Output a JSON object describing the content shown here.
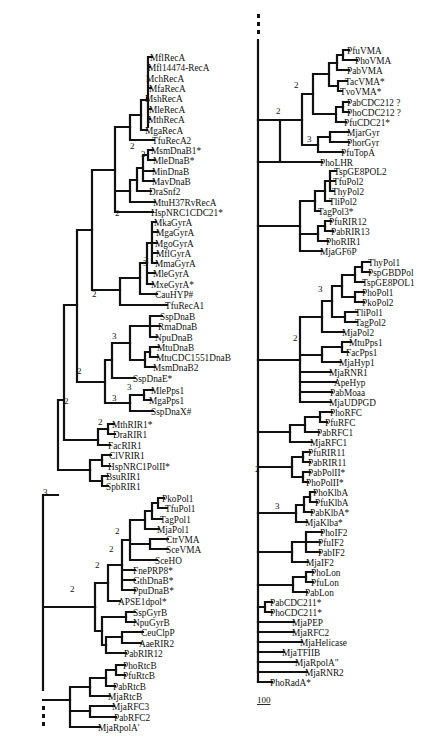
{
  "figure": {
    "type": "phylogenetic-tree",
    "panels": 2,
    "scale_bar_label": "100",
    "continuation_marker": "⋮",
    "line_color": "#111111",
    "background": "#ffffff"
  },
  "left_tree": {
    "leaves": [
      {
        "label": "MflRecA",
        "x": 150,
        "y": 57
      },
      {
        "label": "Mfl14474-RecA",
        "x": 148,
        "y": 67
      },
      {
        "label": "MchRecA",
        "x": 146,
        "y": 78
      },
      {
        "label": "MfaRecA",
        "x": 149,
        "y": 88
      },
      {
        "label": "MshRecA",
        "x": 145,
        "y": 98
      },
      {
        "label": "MleRecA",
        "x": 149,
        "y": 109
      },
      {
        "label": "MthRecA",
        "x": 148,
        "y": 119
      },
      {
        "label": "MgaRecA",
        "x": 145,
        "y": 130
      },
      {
        "label": "TfuRecA2",
        "x": 152,
        "y": 140
      },
      {
        "label": "MsmDnaB1*",
        "x": 151,
        "y": 150
      },
      {
        "label": "MleDnaB*",
        "x": 153,
        "y": 160
      },
      {
        "label": "MinDnaB",
        "x": 152,
        "y": 171
      },
      {
        "label": "MavDnaB",
        "x": 152,
        "y": 181
      },
      {
        "label": "DraSnf2",
        "x": 149,
        "y": 191
      },
      {
        "label": "MtuH37RvRecA",
        "x": 153,
        "y": 202
      },
      {
        "label": "HspNRC1CDC21*",
        "x": 151,
        "y": 212
      },
      {
        "label": "MkaGyrA",
        "x": 154,
        "y": 222
      },
      {
        "label": "MgaGyrA",
        "x": 156,
        "y": 232
      },
      {
        "label": "MgoGyrA",
        "x": 155,
        "y": 243
      },
      {
        "label": "MflGyrA",
        "x": 156,
        "y": 253
      },
      {
        "label": "MmaGyrA",
        "x": 155,
        "y": 263
      },
      {
        "label": "MleGyrA",
        "x": 153,
        "y": 273
      },
      {
        "label": "MxeGyrA*",
        "x": 151,
        "y": 284
      },
      {
        "label": "CauHYP#",
        "x": 155,
        "y": 294
      },
      {
        "label": "TfuRecA1",
        "x": 165,
        "y": 305
      },
      {
        "label": "SspDnaB",
        "x": 160,
        "y": 316
      },
      {
        "label": "RmaDnaB",
        "x": 158,
        "y": 326
      },
      {
        "label": "NpuDnaB",
        "x": 155,
        "y": 337
      },
      {
        "label": "MtuDnaB",
        "x": 157,
        "y": 347
      },
      {
        "label": "MtuCDC1551DnaB",
        "x": 156,
        "y": 357
      },
      {
        "label": "MsmDnaB2",
        "x": 153,
        "y": 367
      },
      {
        "label": "SspDnaE*",
        "x": 133,
        "y": 378
      },
      {
        "label": "MlePps1",
        "x": 151,
        "y": 390
      },
      {
        "label": "MgaPps1",
        "x": 149,
        "y": 400
      },
      {
        "label": "SspDnaX#",
        "x": 151,
        "y": 411
      },
      {
        "label": "MthRIR1*",
        "x": 112,
        "y": 424
      },
      {
        "label": "DraRIR1",
        "x": 113,
        "y": 434
      },
      {
        "label": "FacRIR1",
        "x": 108,
        "y": 445
      },
      {
        "label": "ClVRIR1",
        "x": 109,
        "y": 455
      },
      {
        "label": "HspNRC1PolII*",
        "x": 108,
        "y": 466
      },
      {
        "label": "BsuRIR1",
        "x": 106,
        "y": 476
      },
      {
        "label": "SpbRIR1",
        "x": 106,
        "y": 486
      },
      {
        "label": "PkoPol1",
        "x": 162,
        "y": 498
      },
      {
        "label": "TfuPol1",
        "x": 165,
        "y": 508
      },
      {
        "label": "TagPol1",
        "x": 160,
        "y": 519
      },
      {
        "label": "MjaPol1",
        "x": 157,
        "y": 529
      },
      {
        "label": "CtrVMA",
        "x": 166,
        "y": 539
      },
      {
        "label": "SceVMA",
        "x": 166,
        "y": 549
      },
      {
        "label": "SceHO",
        "x": 155,
        "y": 560
      },
      {
        "label": "FnePRP8*",
        "x": 133,
        "y": 570
      },
      {
        "label": "GthDnaB*",
        "x": 133,
        "y": 580
      },
      {
        "label": "PpuDnaB*",
        "x": 133,
        "y": 590
      },
      {
        "label": "APSE1dpol*",
        "x": 118,
        "y": 601
      },
      {
        "label": "SspGyrB",
        "x": 133,
        "y": 612
      },
      {
        "label": "NpuGyrB",
        "x": 133,
        "y": 622
      },
      {
        "label": "CeuClpP",
        "x": 141,
        "y": 632
      },
      {
        "label": "AaeRIR2",
        "x": 139,
        "y": 643
      },
      {
        "label": "PabRIR12",
        "x": 124,
        "y": 653
      },
      {
        "label": "PhoRtcB",
        "x": 123,
        "y": 665
      },
      {
        "label": "PfuRtcB",
        "x": 123,
        "y": 675
      },
      {
        "label": "PabRtcB",
        "x": 113,
        "y": 686
      },
      {
        "label": "MjaRtcB",
        "x": 108,
        "y": 696
      },
      {
        "label": "MjaRFC3",
        "x": 112,
        "y": 706
      },
      {
        "label": "PabRFC2",
        "x": 114,
        "y": 717
      },
      {
        "label": "MjaRpolA'",
        "x": 98,
        "y": 727
      }
    ],
    "bootstrap_labels": [
      {
        "text": "3",
        "x": 141,
        "y": 153
      },
      {
        "text": "2",
        "x": 130,
        "y": 145
      },
      {
        "text": "2",
        "x": 115,
        "y": 212
      },
      {
        "text": "3",
        "x": 143,
        "y": 262
      },
      {
        "text": "2",
        "x": 144,
        "y": 259
      },
      {
        "text": "2",
        "x": 92,
        "y": 293
      },
      {
        "text": "3",
        "x": 112,
        "y": 335
      },
      {
        "text": "3",
        "x": 127,
        "y": 386
      },
      {
        "text": "3",
        "x": 112,
        "y": 397
      },
      {
        "text": "2",
        "x": 77,
        "y": 370
      },
      {
        "text": "2",
        "x": 98,
        "y": 421
      },
      {
        "text": "2",
        "x": 64,
        "y": 400
      },
      {
        "text": "3",
        "x": 43,
        "y": 491
      },
      {
        "text": "2",
        "x": 115,
        "y": 530
      },
      {
        "text": "2",
        "x": 109,
        "y": 548
      },
      {
        "text": "2",
        "x": 95,
        "y": 564
      },
      {
        "text": "2",
        "x": 70,
        "y": 588
      }
    ],
    "continuation_dots": {
      "x": 28,
      "y": 690
    }
  },
  "right_tree": {
    "leaves": [
      {
        "label": "PfuVMA",
        "x": 347,
        "y": 50
      },
      {
        "label": "PhoVMA",
        "x": 355,
        "y": 60
      },
      {
        "label": "PabVMA",
        "x": 347,
        "y": 70
      },
      {
        "label": "TacVMA*",
        "x": 345,
        "y": 81
      },
      {
        "label": "TvoVMA*",
        "x": 340,
        "y": 91
      },
      {
        "label": "PabCDC212 ?",
        "x": 347,
        "y": 102
      },
      {
        "label": "PhoCDC212 ?",
        "x": 347,
        "y": 112
      },
      {
        "label": "PfuCDC21*",
        "x": 344,
        "y": 122
      },
      {
        "label": "MjarGyr",
        "x": 347,
        "y": 132
      },
      {
        "label": "PhorGyr",
        "x": 347,
        "y": 142
      },
      {
        "label": "PfuTopA",
        "x": 341,
        "y": 152
      },
      {
        "label": "PhoLHR",
        "x": 320,
        "y": 162
      },
      {
        "label": "TspGE8POL2",
        "x": 334,
        "y": 171
      },
      {
        "label": "TfuPol2",
        "x": 333,
        "y": 181
      },
      {
        "label": "ThyPol2",
        "x": 332,
        "y": 191
      },
      {
        "label": "TliPol2",
        "x": 329,
        "y": 201
      },
      {
        "label": "TagPol3*",
        "x": 318,
        "y": 211
      },
      {
        "label": "PfuRIR12",
        "x": 329,
        "y": 221
      },
      {
        "label": "PabRIR13",
        "x": 331,
        "y": 231
      },
      {
        "label": "PhoRIR1",
        "x": 326,
        "y": 241
      },
      {
        "label": "MjaGF6P",
        "x": 320,
        "y": 251
      },
      {
        "label": "ThyPol1",
        "x": 368,
        "y": 262
      },
      {
        "label": "PspGBDPol",
        "x": 368,
        "y": 272
      },
      {
        "label": "TspGE8POL1",
        "x": 362,
        "y": 282
      },
      {
        "label": "PhoPol1",
        "x": 362,
        "y": 292
      },
      {
        "label": "PkoPol2",
        "x": 362,
        "y": 302
      },
      {
        "label": "TliPol1",
        "x": 355,
        "y": 312
      },
      {
        "label": "TagPol2",
        "x": 355,
        "y": 322
      },
      {
        "label": "MjaPol2",
        "x": 342,
        "y": 332
      },
      {
        "label": "MtuPps1",
        "x": 349,
        "y": 342
      },
      {
        "label": "FacPps1",
        "x": 346,
        "y": 352
      },
      {
        "label": "MjaHyp1",
        "x": 339,
        "y": 362
      },
      {
        "label": "MjaRNR1",
        "x": 329,
        "y": 372
      },
      {
        "label": "ApeHyp",
        "x": 334,
        "y": 382
      },
      {
        "label": "PabMoaa",
        "x": 330,
        "y": 392
      },
      {
        "label": "MjaUDPGD",
        "x": 329,
        "y": 402
      },
      {
        "label": "PhoRFC",
        "x": 330,
        "y": 412
      },
      {
        "label": "PfuRFC",
        "x": 325,
        "y": 422
      },
      {
        "label": "PabRFC1",
        "x": 317,
        "y": 432
      },
      {
        "label": "MjaRFC1",
        "x": 310,
        "y": 442
      },
      {
        "label": "PfuRIR11",
        "x": 308,
        "y": 452
      },
      {
        "label": "PabRIR11",
        "x": 308,
        "y": 462
      },
      {
        "label": "PabPolII*",
        "x": 308,
        "y": 472
      },
      {
        "label": "PhoPolII*",
        "x": 306,
        "y": 482
      },
      {
        "label": "PhoKlbA",
        "x": 313,
        "y": 492
      },
      {
        "label": "PfuKlbA",
        "x": 315,
        "y": 502
      },
      {
        "label": "PabKlbA*",
        "x": 310,
        "y": 512
      },
      {
        "label": "MjaKlba*",
        "x": 305,
        "y": 522
      },
      {
        "label": "PhoIF2",
        "x": 320,
        "y": 532
      },
      {
        "label": "PfuIF2",
        "x": 318,
        "y": 542
      },
      {
        "label": "PabIF2",
        "x": 318,
        "y": 552
      },
      {
        "label": "MjaIF2",
        "x": 306,
        "y": 562
      },
      {
        "label": "PhoLon",
        "x": 311,
        "y": 572
      },
      {
        "label": "PfuLon",
        "x": 311,
        "y": 582
      },
      {
        "label": "PabLon",
        "x": 305,
        "y": 592
      },
      {
        "label": "PabCDC211*",
        "x": 270,
        "y": 602
      },
      {
        "label": "PhoCDC211*",
        "x": 270,
        "y": 612
      },
      {
        "label": "MjaPEP",
        "x": 292,
        "y": 622
      },
      {
        "label": "MjaRFC2",
        "x": 292,
        "y": 632
      },
      {
        "label": "MjaHelicase",
        "x": 300,
        "y": 642
      },
      {
        "label": "MjaTFIIB",
        "x": 282,
        "y": 652
      },
      {
        "label": "MjaRpolA\"",
        "x": 295,
        "y": 662
      },
      {
        "label": "MjaRNR2",
        "x": 305,
        "y": 672
      },
      {
        "label": "PhoRadA*",
        "x": 270,
        "y": 682
      }
    ],
    "bootstrap_labels": [
      {
        "text": "2",
        "x": 276,
        "y": 110
      },
      {
        "text": "2",
        "x": 294,
        "y": 84
      },
      {
        "text": "3",
        "x": 307,
        "y": 138
      },
      {
        "text": "3",
        "x": 318,
        "y": 288
      },
      {
        "text": "2",
        "x": 293,
        "y": 337
      },
      {
        "text": "2",
        "x": 255,
        "y": 468
      },
      {
        "text": "3",
        "x": 275,
        "y": 505
      }
    ],
    "continuation_dots": {
      "x": 263,
      "y": 10
    },
    "scale_bar": {
      "label": "100",
      "x": 257,
      "y": 703
    }
  }
}
